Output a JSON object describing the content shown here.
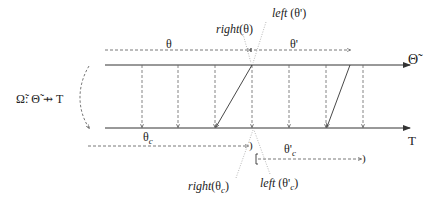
{
  "diagram": {
    "top_axis_label": "Θ̃",
    "bottom_axis_label": "T",
    "mapping_label": "Ω̃: Θ̃ ⇸ T",
    "theta_label": "θ",
    "theta_prime_label": "θ'",
    "theta_c_label": "θ",
    "theta_c_sub": "c",
    "theta_c_prime_label": "θ'",
    "theta_c_prime_sub": "c",
    "right_theta": {
      "fn": "right",
      "arg": "(θ)"
    },
    "left_theta_prime": {
      "fn": "left",
      "arg": "(θ')"
    },
    "right_theta_c": {
      "fn": "right",
      "arg": "(θ",
      "sub": "c",
      "close": ")"
    },
    "left_theta_c_prime": {
      "fn": "left",
      "arg": "(θ'",
      "sub": "c",
      "close": ")"
    },
    "colors": {
      "line": "#333333",
      "dashed": "#555555",
      "dotted": "#888888"
    }
  }
}
